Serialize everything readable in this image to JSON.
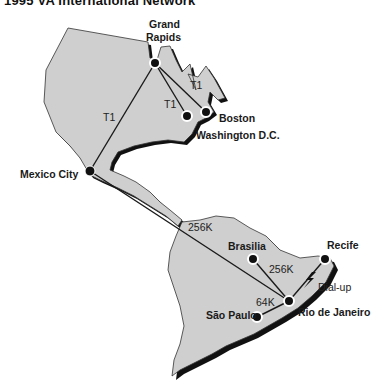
{
  "header": {
    "title": "1995 VA International Network"
  },
  "colors": {
    "land": "#cfcfcf",
    "shadow": "#111111",
    "line": "#1a1a1a",
    "node": "#111111",
    "background": "#ffffff"
  },
  "cities": [
    {
      "id": "grand-rapids",
      "label_line1": "Grand",
      "label_line2": "Rapids",
      "x": 185,
      "y": 62
    },
    {
      "id": "boston",
      "label": "Boston",
      "x": 206,
      "y": 112
    },
    {
      "id": "washington",
      "label": "Washington D.C.",
      "x": 187,
      "y": 116
    },
    {
      "id": "mexico-city",
      "label": "Mexico City",
      "x": 90,
      "y": 171
    },
    {
      "id": "brasilia",
      "label": "Brasilia",
      "x": 253,
      "y": 259
    },
    {
      "id": "recife",
      "label": "Recife",
      "x": 325,
      "y": 259
    },
    {
      "id": "rio",
      "label": "Rio de Janeiro",
      "x": 289,
      "y": 301
    },
    {
      "id": "sao-paulo",
      "label": "São Paulo",
      "x": 257,
      "y": 317
    }
  ],
  "links": [
    {
      "from": "grand-rapids",
      "to": "mexico-city",
      "label": "T1"
    },
    {
      "from": "grand-rapids",
      "to": "washington",
      "label": "T1"
    },
    {
      "from": "grand-rapids",
      "to": "boston",
      "label": "T1"
    },
    {
      "from": "mexico-city",
      "to": "rio",
      "label": "256K"
    },
    {
      "from": "brasilia",
      "to": "rio",
      "label": "256K"
    },
    {
      "from": "rio",
      "to": "recife",
      "label": "Dial-up"
    },
    {
      "from": "rio",
      "to": "sao-paulo",
      "label": "64K"
    }
  ]
}
